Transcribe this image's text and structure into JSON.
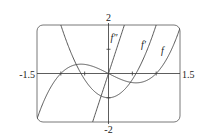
{
  "chart_data": {
    "type": "line",
    "title": "",
    "xlabel": "",
    "ylabel": "",
    "xlim": [
      -1.5,
      1.5
    ],
    "ylim": [
      -2,
      2
    ],
    "x_tick_labels": [
      "-1.5",
      "1.5"
    ],
    "y_tick_labels": [
      "2",
      "-2"
    ],
    "grid": false,
    "series": [
      {
        "name": "f",
        "label": "f",
        "formula": "x^3 - x",
        "x": [
          -1.5,
          -1,
          -0.5,
          0,
          0.5,
          1,
          1.5
        ],
        "values": [
          -1.875,
          0,
          0.375,
          0,
          -0.375,
          0,
          1.875
        ]
      },
      {
        "name": "f'",
        "label": "f′",
        "formula": "3x^2 - 1",
        "x": [
          -1.5,
          -1,
          -0.5,
          0,
          0.5,
          1,
          1.5
        ],
        "values": [
          5.75,
          2,
          -0.25,
          -1,
          -0.25,
          2,
          5.75
        ]
      },
      {
        "name": "f''",
        "label": "f″",
        "formula": "6x",
        "x": [
          -1.5,
          -1,
          -0.5,
          0,
          0.5,
          1,
          1.5
        ],
        "values": [
          -9,
          -6,
          -3,
          0,
          3,
          6,
          9
        ]
      }
    ]
  }
}
